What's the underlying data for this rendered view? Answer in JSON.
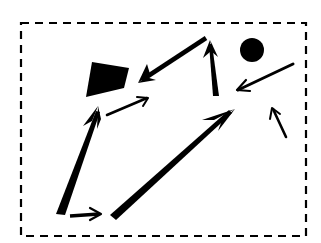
{
  "diagram": {
    "colors": {
      "ink": "#000000",
      "background": "#ffffff"
    },
    "frame": {
      "style": "dashed",
      "x1": 21,
      "y1": 23,
      "x2": 306,
      "y2": 236
    },
    "shapes": [
      {
        "id": "quad",
        "type": "filled-quadrilateral",
        "points": [
          [
            92,
            62
          ],
          [
            129,
            68
          ],
          [
            124,
            88
          ],
          [
            86,
            97
          ]
        ]
      },
      {
        "id": "dot",
        "type": "filled-circle",
        "cx": 252,
        "cy": 50,
        "r": 12
      }
    ],
    "arrows": [
      {
        "id": "a1",
        "from": [
          206,
          38
        ],
        "to": [
          138,
          83
        ],
        "weight": "heavy",
        "head": "open-barbed"
      },
      {
        "id": "a2",
        "from": [
          216,
          96
        ],
        "to": [
          210,
          40
        ],
        "weight": "heavy",
        "head": "open-barbed"
      },
      {
        "id": "a3",
        "from": [
          293,
          64
        ],
        "to": [
          237,
          90
        ],
        "weight": "medium",
        "head": "open"
      },
      {
        "id": "a4",
        "from": [
          107,
          115
        ],
        "to": [
          148,
          98
        ],
        "weight": "light",
        "head": "open"
      },
      {
        "id": "a5",
        "from": [
          286,
          137
        ],
        "to": [
          272,
          108
        ],
        "weight": "light",
        "head": "open"
      },
      {
        "id": "a6",
        "from": [
          60,
          215
        ],
        "to": [
          98,
          106
        ],
        "weight": "heavy",
        "head": "open-barbed"
      },
      {
        "id": "a7",
        "from": [
          70,
          217
        ],
        "to": [
          101,
          214
        ],
        "weight": "medium",
        "head": "open"
      },
      {
        "id": "a8",
        "from": [
          113,
          218
        ],
        "to": [
          235,
          109
        ],
        "weight": "heavy",
        "head": "open-barbed"
      }
    ]
  }
}
